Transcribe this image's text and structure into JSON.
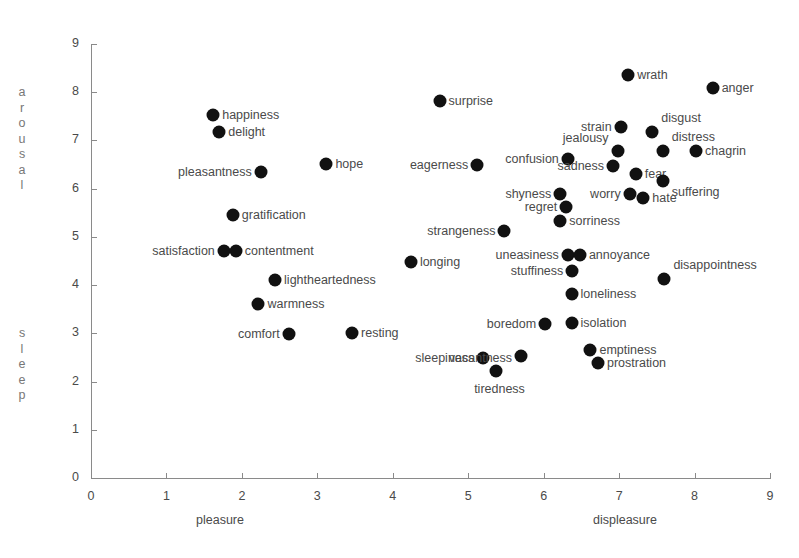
{
  "chart_data": {
    "type": "scatter",
    "title": "",
    "xlabel": "",
    "ylabel": "",
    "xlim": [
      0,
      9
    ],
    "ylim": [
      0,
      9
    ],
    "grid": false,
    "legend": "none",
    "x_axis_left_label": "pleasure",
    "x_axis_right_label": "displeasure",
    "y_axis_top_label": "arousal",
    "y_axis_bottom_label": "sleep",
    "x_ticks": [
      "0",
      "1",
      "2",
      "3",
      "4",
      "5",
      "6",
      "7",
      "8",
      "9"
    ],
    "y_ticks": [
      "0",
      "1",
      "2",
      "3",
      "4",
      "5",
      "6",
      "7",
      "8",
      "9"
    ],
    "marker_color": "#111111",
    "axis_color": "#8a8a8a",
    "points": [
      {
        "label": "happiness",
        "x": 1.62,
        "y": 7.52,
        "side": "right"
      },
      {
        "label": "delight",
        "x": 1.7,
        "y": 7.18,
        "side": "right"
      },
      {
        "label": "pleasantness",
        "x": 2.25,
        "y": 6.35,
        "side": "left"
      },
      {
        "label": "hope",
        "x": 3.12,
        "y": 6.52,
        "side": "right"
      },
      {
        "label": "gratification",
        "x": 1.88,
        "y": 5.46,
        "side": "right"
      },
      {
        "label": "satisfaction",
        "x": 1.76,
        "y": 4.7,
        "side": "left"
      },
      {
        "label": "contentment",
        "x": 1.92,
        "y": 4.7,
        "side": "right"
      },
      {
        "label": "lightheartedness",
        "x": 2.44,
        "y": 4.1,
        "side": "right"
      },
      {
        "label": "warmness",
        "x": 2.22,
        "y": 3.6,
        "side": "right"
      },
      {
        "label": "comfort",
        "x": 2.62,
        "y": 2.98,
        "side": "left"
      },
      {
        "label": "resting",
        "x": 3.46,
        "y": 3.0,
        "side": "right"
      },
      {
        "label": "surprise",
        "x": 4.62,
        "y": 7.82,
        "side": "right"
      },
      {
        "label": "eagerness",
        "x": 5.12,
        "y": 6.5,
        "side": "left"
      },
      {
        "label": "strangeness",
        "x": 5.48,
        "y": 5.12,
        "side": "left"
      },
      {
        "label": "longing",
        "x": 4.24,
        "y": 4.48,
        "side": "right"
      },
      {
        "label": "sleepiness",
        "x": 5.2,
        "y": 2.48,
        "side": "left"
      },
      {
        "label": "tiredness",
        "x": 5.37,
        "y": 2.22,
        "side": "below"
      },
      {
        "label": "vacantness",
        "x": 5.7,
        "y": 2.52,
        "side": "leftbelow"
      },
      {
        "label": "boredom",
        "x": 6.02,
        "y": 3.2,
        "side": "left"
      },
      {
        "label": "isolation",
        "x": 6.37,
        "y": 3.22,
        "side": "right"
      },
      {
        "label": "loneliness",
        "x": 6.37,
        "y": 3.82,
        "side": "right"
      },
      {
        "label": "stuffiness",
        "x": 6.38,
        "y": 4.3,
        "side": "left"
      },
      {
        "label": "uneasiness",
        "x": 6.32,
        "y": 4.62,
        "side": "left"
      },
      {
        "label": "annoyance",
        "x": 6.48,
        "y": 4.62,
        "side": "right"
      },
      {
        "label": "disappointness",
        "x": 7.6,
        "y": 4.12,
        "side": "rightup"
      },
      {
        "label": "sorriness",
        "x": 6.22,
        "y": 5.32,
        "side": "right"
      },
      {
        "label": "regret",
        "x": 6.3,
        "y": 5.62,
        "side": "left"
      },
      {
        "label": "shyness",
        "x": 6.22,
        "y": 5.88,
        "side": "left"
      },
      {
        "label": "confusion",
        "x": 6.32,
        "y": 6.62,
        "side": "left"
      },
      {
        "label": "jealousy",
        "x": 6.98,
        "y": 6.78,
        "side": "leftup"
      },
      {
        "label": "strain",
        "x": 7.02,
        "y": 7.28,
        "side": "left"
      },
      {
        "label": "sadness",
        "x": 6.92,
        "y": 6.48,
        "side": "left"
      },
      {
        "label": "worry",
        "x": 7.14,
        "y": 5.88,
        "side": "left"
      },
      {
        "label": "fear",
        "x": 7.22,
        "y": 6.3,
        "side": "right"
      },
      {
        "label": "hate",
        "x": 7.32,
        "y": 5.8,
        "side": "right"
      },
      {
        "label": "wrath",
        "x": 7.12,
        "y": 8.35,
        "side": "right"
      },
      {
        "label": "anger",
        "x": 8.24,
        "y": 8.08,
        "side": "right"
      },
      {
        "label": "disgust",
        "x": 7.44,
        "y": 7.18,
        "side": "rightup"
      },
      {
        "label": "distress",
        "x": 7.58,
        "y": 6.78,
        "side": "rightup"
      },
      {
        "label": "chagrin",
        "x": 8.02,
        "y": 6.78,
        "side": "right"
      },
      {
        "label": "suffering",
        "x": 7.58,
        "y": 6.16,
        "side": "rightdown"
      },
      {
        "label": "emptiness",
        "x": 6.62,
        "y": 2.65,
        "side": "right"
      },
      {
        "label": "prostration",
        "x": 6.72,
        "y": 2.38,
        "side": "right"
      }
    ]
  }
}
